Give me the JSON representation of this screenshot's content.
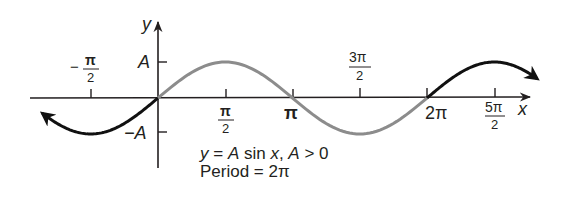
{
  "chart_data": {
    "type": "line",
    "title": "",
    "xlabel": "x",
    "ylabel": "y",
    "function": "y = A sin x",
    "x_ticks": [
      "-π/2",
      "π/2",
      "π",
      "3π/2",
      "2π",
      "5π/2"
    ],
    "y_ticks": [
      "A",
      "-A"
    ],
    "xlim": [
      -2.0,
      8.3
    ],
    "ylim": [
      -1.9,
      2.1
    ],
    "series": [
      {
        "name": "left extension",
        "color": "#111111",
        "x_range": [
          "-π",
          "0"
        ],
        "description": "sin curve, arrow at left end"
      },
      {
        "name": "one period",
        "color": "#8a8a8a",
        "x_range": [
          "0",
          "2π"
        ],
        "description": "highlighted one period of sine"
      },
      {
        "name": "right extension",
        "color": "#111111",
        "x_range": [
          "2π",
          "~2.85π"
        ],
        "description": "sin curve, arrow at right end"
      }
    ],
    "key_points": [
      {
        "x": "-π/2",
        "y": "-A"
      },
      {
        "x": "0",
        "y": "0"
      },
      {
        "x": "π/2",
        "y": "A"
      },
      {
        "x": "π",
        "y": "0"
      },
      {
        "x": "3π/2",
        "y": "-A"
      },
      {
        "x": "2π",
        "y": "0"
      },
      {
        "x": "5π/2",
        "y": "A"
      }
    ],
    "annotations": [
      "y = A sin x, A > 0",
      "Period = 2π"
    ],
    "grid": false,
    "legend": "none"
  },
  "axes": {
    "x_label": "x",
    "y_label": "y",
    "tick_A": "A",
    "tick_negA": "−A",
    "tick_neg_pi_half_num": "π",
    "tick_neg_pi_half_den": "2",
    "tick_neg_sign": "−",
    "tick_pi_half_num": "π",
    "tick_pi_half_den": "2",
    "tick_pi": "π",
    "tick_3pi_half_num": "3π",
    "tick_3pi_half_den": "2",
    "tick_2pi": "2π",
    "tick_5pi_half_num": "5π",
    "tick_5pi_half_den": "2"
  },
  "caption": {
    "line1_y": "y",
    "line1_eq": " = ",
    "line1_A": "A",
    "line1_sin": " sin ",
    "line1_x": "x",
    "line1_rest1": ", ",
    "line1_A2": "A",
    "line1_rest2": " > 0",
    "line2": "Period = 2π"
  },
  "colors": {
    "axis": "#231f20",
    "curve_black": "#111111",
    "curve_gray": "#8c8c8c"
  }
}
